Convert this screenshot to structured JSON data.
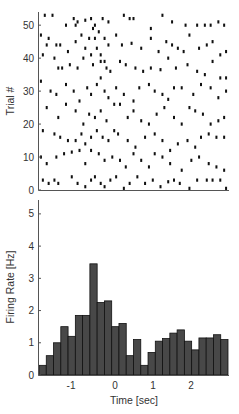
{
  "chart_data": [
    {
      "type": "scatter",
      "subtype": "spike-raster",
      "title": "",
      "xlabel": "",
      "ylabel": "Trial #",
      "xlim": [
        -1.9,
        3.0
      ],
      "ylim": [
        0,
        54
      ],
      "yticks": [
        0,
        10,
        20,
        30,
        40,
        50
      ],
      "yticklabels": [
        "0",
        "10",
        "20",
        "30",
        "40",
        "50"
      ],
      "xticks": [],
      "grid": false,
      "legend": null,
      "marker_color": "#111111",
      "spikes": [
        [
          -1.75,
          53
        ],
        [
          -1.55,
          53
        ],
        [
          -1.2,
          50
        ],
        [
          -1.0,
          52
        ],
        [
          -0.95,
          50
        ],
        [
          -0.9,
          51
        ],
        [
          -0.7,
          51.5
        ],
        [
          -0.55,
          52
        ],
        [
          -0.5,
          49
        ],
        [
          -0.45,
          50
        ],
        [
          -0.35,
          48
        ],
        [
          -0.25,
          52
        ],
        [
          -0.1,
          51
        ],
        [
          0.3,
          53
        ],
        [
          0.45,
          52
        ],
        [
          0.55,
          52
        ],
        [
          1.0,
          49
        ],
        [
          1.3,
          53
        ],
        [
          1.55,
          51
        ],
        [
          1.9,
          50
        ],
        [
          2.2,
          50
        ],
        [
          2.4,
          50
        ],
        [
          2.55,
          50
        ],
        [
          2.75,
          51
        ],
        [
          2.9,
          50
        ],
        [
          -1.85,
          47
        ],
        [
          -1.65,
          46
        ],
        [
          -1.7,
          44
        ],
        [
          -1.45,
          44
        ],
        [
          -1.35,
          44
        ],
        [
          -1.15,
          42
        ],
        [
          -0.95,
          45
        ],
        [
          -0.8,
          47
        ],
        [
          -0.7,
          43
        ],
        [
          -0.6,
          46
        ],
        [
          -0.45,
          46
        ],
        [
          -0.4,
          43
        ],
        [
          -0.3,
          41
        ],
        [
          -0.2,
          46
        ],
        [
          -0.1,
          44
        ],
        [
          0.1,
          47
        ],
        [
          0.25,
          44
        ],
        [
          0.5,
          44.5
        ],
        [
          0.75,
          43
        ],
        [
          1.0,
          46
        ],
        [
          1.2,
          42
        ],
        [
          1.4,
          45
        ],
        [
          1.55,
          44
        ],
        [
          1.7,
          43
        ],
        [
          1.85,
          42
        ],
        [
          2.0,
          47
        ],
        [
          2.25,
          43
        ],
        [
          2.45,
          44
        ],
        [
          2.6,
          45
        ],
        [
          2.8,
          41
        ],
        [
          2.95,
          42
        ],
        [
          -1.8,
          41
        ],
        [
          -1.5,
          40
        ],
        [
          -1.4,
          37
        ],
        [
          -1.3,
          37
        ],
        [
          -1.1,
          38
        ],
        [
          -0.9,
          37
        ],
        [
          -0.75,
          40
        ],
        [
          -0.55,
          41
        ],
        [
          -0.5,
          38
        ],
        [
          -0.3,
          39
        ],
        [
          -0.2,
          39
        ],
        [
          -0.15,
          37
        ],
        [
          -0.05,
          36
        ],
        [
          0.2,
          39
        ],
        [
          0.35,
          38
        ],
        [
          0.6,
          37
        ],
        [
          0.8,
          36
        ],
        [
          1.0,
          37
        ],
        [
          1.25,
          36.5
        ],
        [
          1.45,
          40
        ],
        [
          1.65,
          37
        ],
        [
          1.95,
          38
        ],
        [
          2.2,
          36
        ],
        [
          2.4,
          35
        ],
        [
          2.6,
          39
        ],
        [
          2.8,
          34
        ],
        [
          2.95,
          34
        ],
        [
          -1.85,
          33
        ],
        [
          -1.6,
          30
        ],
        [
          -1.45,
          29
        ],
        [
          -1.2,
          32
        ],
        [
          -1.0,
          30
        ],
        [
          -0.85,
          27
        ],
        [
          -0.65,
          31
        ],
        [
          -0.55,
          29
        ],
        [
          -0.4,
          32
        ],
        [
          -0.3,
          34
        ],
        [
          -0.2,
          30
        ],
        [
          -0.1,
          28
        ],
        [
          0.1,
          31
        ],
        [
          0.3,
          29
        ],
        [
          0.55,
          27
        ],
        [
          0.7,
          31
        ],
        [
          0.95,
          32
        ],
        [
          1.1,
          30
        ],
        [
          1.3,
          29
        ],
        [
          1.45,
          27.5
        ],
        [
          1.6,
          31
        ],
        [
          1.8,
          31
        ],
        [
          2.1,
          29
        ],
        [
          2.3,
          32
        ],
        [
          2.55,
          31
        ],
        [
          2.75,
          28
        ],
        [
          2.95,
          30
        ],
        [
          -1.7,
          25
        ],
        [
          -1.4,
          22
        ],
        [
          -1.2,
          26
        ],
        [
          -0.95,
          24
        ],
        [
          -0.75,
          20
        ],
        [
          -0.6,
          23
        ],
        [
          -0.45,
          22
        ],
        [
          -0.3,
          24
        ],
        [
          -0.15,
          21
        ],
        [
          0.05,
          26
        ],
        [
          0.2,
          26
        ],
        [
          0.4,
          22
        ],
        [
          0.55,
          24
        ],
        [
          0.75,
          21
        ],
        [
          0.95,
          20
        ],
        [
          1.15,
          23
        ],
        [
          1.35,
          25
        ],
        [
          1.6,
          22
        ],
        [
          1.8,
          20
        ],
        [
          2.0,
          25
        ],
        [
          2.15,
          24
        ],
        [
          2.35,
          23
        ],
        [
          2.55,
          20
        ],
        [
          2.75,
          21
        ],
        [
          2.9,
          22
        ],
        [
          -1.8,
          18
        ],
        [
          -1.5,
          17
        ],
        [
          -1.35,
          16
        ],
        [
          -1.15,
          15
        ],
        [
          -0.95,
          15
        ],
        [
          -0.8,
          17
        ],
        [
          -0.7,
          14
        ],
        [
          -0.55,
          16
        ],
        [
          -0.4,
          18
        ],
        [
          -0.25,
          16
        ],
        [
          -0.1,
          15
        ],
        [
          0.05,
          18
        ],
        [
          0.15,
          17
        ],
        [
          0.4,
          15
        ],
        [
          0.6,
          13
        ],
        [
          0.85,
          16
        ],
        [
          1.1,
          17
        ],
        [
          1.3,
          15
        ],
        [
          1.5,
          12
        ],
        [
          1.7,
          14
        ],
        [
          1.95,
          15
        ],
        [
          2.15,
          13
        ],
        [
          2.3,
          16
        ],
        [
          2.5,
          17
        ],
        [
          2.7,
          16
        ],
        [
          2.9,
          16
        ],
        [
          -1.85,
          10
        ],
        [
          -1.7,
          8
        ],
        [
          -1.45,
          10
        ],
        [
          -1.25,
          11
        ],
        [
          -1.05,
          11.5
        ],
        [
          -0.85,
          12
        ],
        [
          -0.7,
          8
        ],
        [
          -0.55,
          12
        ],
        [
          -0.35,
          11
        ],
        [
          -0.2,
          9
        ],
        [
          0.0,
          10
        ],
        [
          0.2,
          9
        ],
        [
          0.35,
          7
        ],
        [
          0.55,
          11
        ],
        [
          0.75,
          9
        ],
        [
          0.95,
          7
        ],
        [
          1.1,
          11
        ],
        [
          1.3,
          10
        ],
        [
          1.5,
          8
        ],
        [
          1.8,
          6
        ],
        [
          2.05,
          9
        ],
        [
          2.25,
          10
        ],
        [
          2.5,
          8
        ],
        [
          2.7,
          7
        ],
        [
          2.9,
          6
        ],
        [
          -1.8,
          3
        ],
        [
          -1.65,
          2
        ],
        [
          -1.5,
          3
        ],
        [
          -1.4,
          2
        ],
        [
          -1.05,
          4
        ],
        [
          -0.9,
          2
        ],
        [
          -0.7,
          1
        ],
        [
          -0.55,
          3
        ],
        [
          -0.45,
          4
        ],
        [
          -0.3,
          2
        ],
        [
          -0.2,
          1
        ],
        [
          -0.05,
          3
        ],
        [
          0.1,
          4
        ],
        [
          0.3,
          0.5
        ],
        [
          0.45,
          2
        ],
        [
          0.65,
          4
        ],
        [
          0.85,
          2
        ],
        [
          1.05,
          3
        ],
        [
          1.25,
          1
        ],
        [
          1.45,
          2.5
        ],
        [
          1.6,
          3
        ],
        [
          1.75,
          2
        ],
        [
          2.0,
          0.5
        ],
        [
          2.2,
          3
        ],
        [
          2.45,
          3
        ],
        [
          2.6,
          3
        ],
        [
          2.8,
          3
        ],
        [
          2.95,
          0.5
        ]
      ]
    },
    {
      "type": "bar",
      "subtype": "peri-stimulus time histogram",
      "title": "",
      "xlabel": "Time [sec]",
      "ylabel": "Firing Rate [Hz]",
      "xlim": [
        -1.9,
        3.0
      ],
      "ylim": [
        0,
        5.4
      ],
      "xticks": [
        -1,
        0,
        1,
        2
      ],
      "xticklabels": [
        "-1",
        "0",
        "1",
        "2"
      ],
      "yticks": [
        0,
        1,
        2,
        3,
        4,
        5
      ],
      "yticklabels": [
        "0",
        "1",
        "2",
        "3",
        "4",
        "5"
      ],
      "grid": false,
      "legend": null,
      "bar_color": "#484848",
      "bar_edge_color": "#111111",
      "bin_width": 0.188,
      "bin_start": -1.9,
      "values": [
        0.3,
        0.6,
        1.0,
        1.5,
        1.2,
        1.85,
        1.85,
        3.45,
        2.25,
        2.3,
        1.5,
        1.6,
        0.6,
        1.1,
        0.3,
        0.7,
        1.05,
        1.13,
        1.3,
        1.4,
        1.05,
        0.78,
        1.15,
        1.15,
        1.25,
        1.1
      ]
    }
  ],
  "raster": {
    "ylabel": "Trial #"
  },
  "histogram": {
    "xlabel": "Time [sec]",
    "ylabel": "Firing Rate [Hz]"
  }
}
